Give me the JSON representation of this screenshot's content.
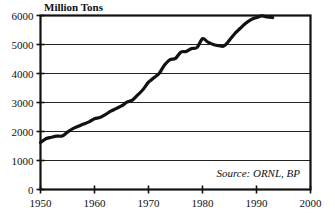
{
  "chart_data": {
    "type": "line",
    "title": "Million Tons",
    "xlabel": "",
    "ylabel": "Million Tons",
    "xlim": [
      1950,
      2000
    ],
    "ylim": [
      0,
      6000
    ],
    "grid": true,
    "legend": "none",
    "annotation": "Source: ORNL, BP",
    "annotation_position": "bottom-right-inside",
    "line_color": "#111111",
    "x_ticks": [
      1950,
      1960,
      1970,
      1980,
      1990,
      2000
    ],
    "x_tick_labels": [
      "1950",
      "1960",
      "1970",
      "1980",
      "1990",
      "2000"
    ],
    "y_ticks": [
      0,
      1000,
      2000,
      3000,
      4000,
      5000,
      6000
    ],
    "y_tick_labels": [
      "0",
      "1000",
      "2000",
      "3000",
      "4000",
      "5000",
      "6000"
    ],
    "x": [
      1950,
      1951,
      1952,
      1953,
      1954,
      1955,
      1956,
      1957,
      1958,
      1959,
      1960,
      1961,
      1962,
      1963,
      1964,
      1965,
      1966,
      1967,
      1968,
      1969,
      1970,
      1971,
      1972,
      1973,
      1974,
      1975,
      1976,
      1977,
      1978,
      1979,
      1980,
      1981,
      1982,
      1983,
      1984,
      1985,
      1986,
      1987,
      1988,
      1989,
      1990,
      1991,
      1992,
      1993
    ],
    "values": [
      1620,
      1750,
      1800,
      1840,
      1845,
      1980,
      2100,
      2180,
      2260,
      2330,
      2440,
      2480,
      2580,
      2700,
      2790,
      2880,
      3010,
      3080,
      3260,
      3450,
      3700,
      3850,
      4010,
      4300,
      4480,
      4520,
      4740,
      4760,
      4860,
      4900,
      5200,
      5080,
      5000,
      4960,
      4950,
      5150,
      5380,
      5560,
      5730,
      5860,
      5930,
      5990,
      5950,
      5930
    ],
    "series": [
      {
        "name": "Million Tons",
        "values": [
          1620,
          1750,
          1800,
          1840,
          1845,
          1980,
          2100,
          2180,
          2260,
          2330,
          2440,
          2480,
          2580,
          2700,
          2790,
          2880,
          3010,
          3080,
          3260,
          3450,
          3700,
          3850,
          4010,
          4300,
          4480,
          4520,
          4740,
          4760,
          4860,
          4900,
          5200,
          5080,
          5000,
          4960,
          4950,
          5150,
          5380,
          5560,
          5730,
          5860,
          5930,
          5990,
          5950,
          5930
        ]
      }
    ]
  }
}
